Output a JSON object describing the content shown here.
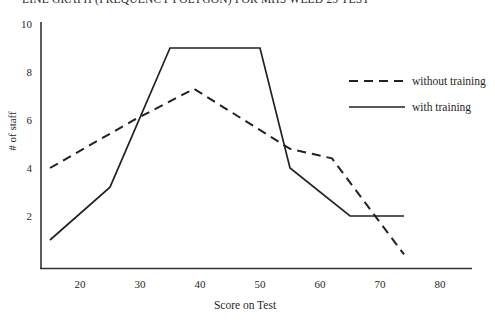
{
  "chart_data": {
    "type": "line",
    "title": "LINE GRAPH (FREQUENCY POLYGON) FOR MHS WELD 25 TEST",
    "xlabel": "Score on Test",
    "ylabel": "# of staff",
    "xlim": [
      13,
      82
    ],
    "ylim": [
      0,
      10
    ],
    "grid": false,
    "legend_position": "right-top",
    "xticks": [
      "20",
      "30",
      "40",
      "50",
      "60",
      "70",
      "80"
    ],
    "xtick_values": [
      20,
      30,
      40,
      50,
      60,
      70,
      80
    ],
    "yticks": [
      "2",
      "4",
      "6",
      "8",
      "10"
    ],
    "ytick_values": [
      2,
      4,
      6,
      8,
      10
    ],
    "series": [
      {
        "name": "without training",
        "style": "dashed",
        "color": "#222222",
        "x": [
          15,
          29,
          39,
          55,
          62,
          74
        ],
        "y": [
          4.0,
          6.0,
          7.3,
          4.8,
          4.4,
          0.4
        ]
      },
      {
        "name": "with training",
        "style": "solid",
        "color": "#222222",
        "x": [
          15,
          25,
          35,
          50,
          55,
          65,
          74
        ],
        "y": [
          1.0,
          3.2,
          9.0,
          9.0,
          4.0,
          2.0,
          2.0
        ]
      }
    ]
  },
  "legend": {
    "items": [
      {
        "label": "without training",
        "style": "dashed"
      },
      {
        "label": "with training",
        "style": "solid"
      }
    ]
  }
}
